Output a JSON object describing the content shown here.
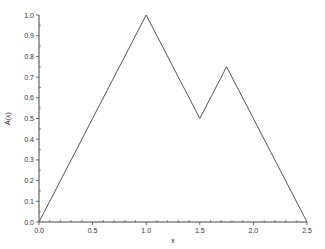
{
  "chart_data": {
    "type": "line",
    "title": "",
    "xlabel": "x",
    "ylabel": "A(x)",
    "xlim": [
      0.0,
      2.5
    ],
    "ylim": [
      0.0,
      1.0
    ],
    "grid": false,
    "legend": null,
    "x_ticks": [
      "0.0",
      "0.5",
      "1.0",
      "1.5",
      "2.0",
      "2.5"
    ],
    "y_ticks": [
      "0.0",
      "0.1",
      "0.2",
      "0.3",
      "0.4",
      "0.5",
      "0.6",
      "0.7",
      "0.8",
      "0.9",
      "1.0"
    ],
    "series": [
      {
        "name": "A(x)",
        "color": "#555555",
        "x": [
          0.0,
          1.0,
          1.5,
          1.75,
          2.5
        ],
        "y": [
          0.0,
          1.0,
          0.5,
          0.75,
          0.0
        ]
      }
    ]
  },
  "layout": {
    "plot_left": 39,
    "plot_right": 307,
    "plot_top": 15,
    "plot_bottom": 222
  }
}
